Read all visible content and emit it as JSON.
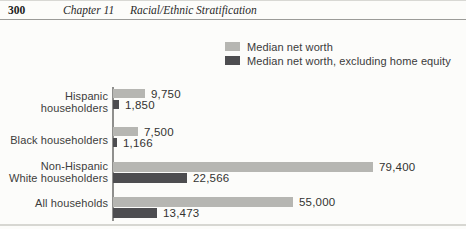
{
  "page": {
    "page_number": "300",
    "chapter": "Chapter 11",
    "chapter_title": "Racial/Ethnic Stratification"
  },
  "legend": [
    {
      "label": "Median net worth",
      "color": "#b6b6b2"
    },
    {
      "label": "Median net worth, excluding home equity",
      "color": "#4d4d50"
    }
  ],
  "chart_data": {
    "type": "bar",
    "orientation": "horizontal",
    "title": "",
    "xlabel": "",
    "ylabel": "",
    "xlim": [
      0,
      84000
    ],
    "gridlines": false,
    "legend_position": "top-right",
    "categories": [
      "Hispanic householders",
      "Black householders",
      "Non-Hispanic White householders",
      "All households"
    ],
    "category_lines": [
      [
        "Hispanic",
        "householders"
      ],
      [
        "Black householders"
      ],
      [
        "Non-Hispanic",
        "White householders"
      ],
      [
        "All households"
      ]
    ],
    "series": [
      {
        "name": "Median net worth",
        "color": "#b6b6b2",
        "values": [
          9750,
          7500,
          79400,
          55000
        ],
        "labels": [
          "9,750",
          "7,500",
          "79,400",
          "55,000"
        ]
      },
      {
        "name": "Median net worth, excluding home equity",
        "color": "#4d4d50",
        "values": [
          1850,
          1166,
          22566,
          13473
        ],
        "labels": [
          "1,850",
          "1,166",
          "22,566",
          "13,473"
        ]
      }
    ]
  }
}
